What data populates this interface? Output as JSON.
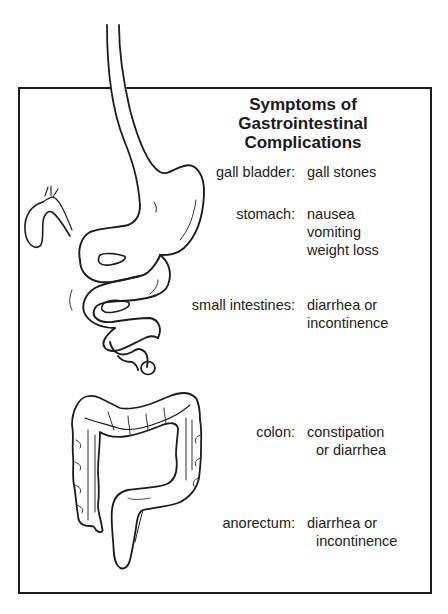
{
  "title": {
    "line1": "Symptoms of",
    "line2": "Gastrointestinal Complications"
  },
  "organs": [
    {
      "name": "gall bladder:",
      "symptoms": [
        "gall stones"
      ]
    },
    {
      "name": "stomach:",
      "symptoms": [
        "nausea",
        "vomiting",
        "weight loss"
      ]
    },
    {
      "name": "small intestines:",
      "symptoms": [
        "diarrhea or",
        "incontinence"
      ]
    },
    {
      "name": "colon:",
      "symptoms": [
        "constipation",
        "or diarrhea"
      ]
    },
    {
      "name": "anorectum:",
      "symptoms": [
        "diarrhea or",
        "incontinence"
      ]
    }
  ],
  "illustrations": [
    "esophagus-icon",
    "gall-bladder-icon",
    "stomach-icon",
    "small-intestine-icon",
    "colon-icon",
    "rectum-icon"
  ],
  "colors": {
    "line": "#1c1c1c",
    "background": "#ffffff"
  }
}
